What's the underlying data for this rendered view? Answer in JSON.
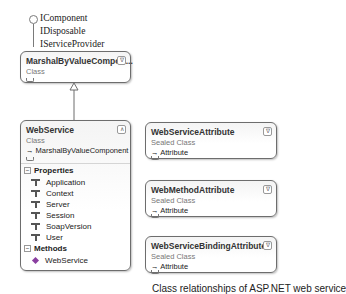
{
  "interfaces": {
    "labels": [
      "IComponent",
      "IDisposable",
      "IServiceProvider"
    ]
  },
  "base_class": {
    "name": "MarshalByValueCompon...",
    "type": "Class",
    "collapse_icon": "collapse-icon"
  },
  "web_service": {
    "name": "WebService",
    "type": "Class",
    "base": "MarshalByValueComponent",
    "sections": {
      "properties": {
        "label": "Properties",
        "items": [
          "Application",
          "Context",
          "Server",
          "Session",
          "SoapVersion",
          "User"
        ]
      },
      "methods": {
        "label": "Methods",
        "items": [
          "WebService"
        ]
      }
    }
  },
  "attributes": [
    {
      "name": "WebServiceAttribute",
      "type": "Sealed Class",
      "base": "Attribute"
    },
    {
      "name": "WebMethodAttribute",
      "type": "Sealed Class",
      "base": "Attribute"
    },
    {
      "name": "WebServiceBindingAttribute",
      "type": "Sealed Class",
      "base": "Attribute"
    }
  ],
  "caption": "Class relationships of ASP.NET web service",
  "colors": {
    "border": "#6d6d6d",
    "title_text": "#333333",
    "type_text": "#777777",
    "method_icon": "#8a3fa0"
  }
}
